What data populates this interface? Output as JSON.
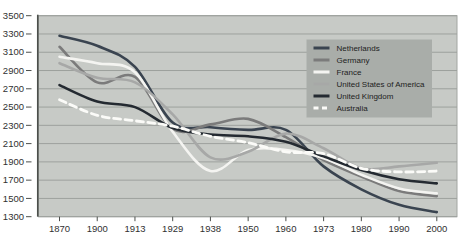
{
  "page": {
    "background": "#ffffff"
  },
  "chart": {
    "plot_bg": "#c7cac6",
    "plot_border": "#a2a6a2",
    "grid_color": "#9da19d",
    "axis_color": "#4c4f4c",
    "label_color": "#313131",
    "legend_bg": "#a9ada9",
    "legend_text_color": "#1d1d1d"
  },
  "chart_data": {
    "type": "line",
    "title": "",
    "xlabel": "",
    "ylabel": "",
    "ylim": [
      1300,
      3500
    ],
    "ytick_step": 200,
    "y_tick_labels": [
      "1300",
      "1500",
      "1700",
      "1900",
      "2100",
      "2300",
      "2500",
      "2700",
      "2900",
      "3100",
      "3300",
      "3500"
    ],
    "grid": "horizontal",
    "legend_position": "upper-right-inside",
    "categories": [
      "1870",
      "1900",
      "1913",
      "1929",
      "1938",
      "1950",
      "1960",
      "1973",
      "1980",
      "1990",
      "2000"
    ],
    "series": [
      {
        "name": "Netherlands",
        "color": "#3a4450",
        "style": "solid",
        "values": [
          3280,
          3170,
          2940,
          2330,
          2280,
          2250,
          2250,
          1850,
          1600,
          1430,
          1350
        ]
      },
      {
        "name": "Germany",
        "color": "#7b7b7b",
        "style": "solid",
        "values": [
          3160,
          2770,
          2830,
          2260,
          2310,
          2370,
          2170,
          1920,
          1740,
          1580,
          1525
        ]
      },
      {
        "name": "France",
        "color": "#f4f4f1",
        "style": "solid",
        "values": [
          3050,
          2980,
          2880,
          2230,
          1800,
          2030,
          2030,
          1940,
          1760,
          1610,
          1555
        ]
      },
      {
        "name": "United States of America",
        "color": "#a7a8a7",
        "style": "solid",
        "values": [
          2980,
          2820,
          2770,
          2420,
          1950,
          2010,
          2210,
          2050,
          1830,
          1850,
          1890
        ]
      },
      {
        "name": "United Kingdom",
        "color": "#242a31",
        "style": "solid",
        "values": [
          2740,
          2560,
          2500,
          2270,
          2200,
          2180,
          2120,
          1960,
          1810,
          1710,
          1665
        ]
      },
      {
        "name": "Australia",
        "color": "#fbfbf8",
        "style": "dashed",
        "values": [
          2580,
          2410,
          2350,
          2290,
          2180,
          2110,
          2010,
          1990,
          1830,
          1790,
          1800
        ]
      }
    ]
  }
}
